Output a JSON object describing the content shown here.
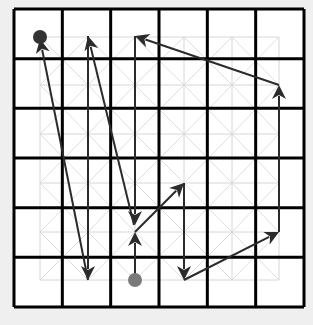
{
  "diagram": {
    "type": "grid-path",
    "grid": {
      "cols": 6,
      "rows": 6,
      "left": 14,
      "top": 9,
      "right": 304,
      "bottom": 307,
      "col_centers": [
        40,
        88,
        135,
        184,
        232,
        279
      ],
      "row_centers": [
        37,
        85,
        134,
        183,
        232,
        280
      ],
      "border_color": "#000000",
      "sub_grid_color": "#d6d6d6"
    },
    "markers": [
      {
        "name": "end-dot",
        "col": 0,
        "row": 0,
        "x": 40,
        "y": 37,
        "color": "#333333"
      },
      {
        "name": "start-dot",
        "col": 2,
        "row": 5,
        "x": 135,
        "y": 280,
        "color": "#7a7a7a"
      }
    ],
    "arrow_color": "#2b2b2b",
    "arrows": [
      {
        "from": [
          135,
          280
        ],
        "to": [
          135,
          232
        ]
      },
      {
        "from": [
          135,
          232
        ],
        "to": [
          184,
          183
        ]
      },
      {
        "from": [
          184,
          183
        ],
        "to": [
          184,
          280
        ]
      },
      {
        "from": [
          184,
          280
        ],
        "to": [
          279,
          232
        ]
      },
      {
        "from": [
          279,
          232
        ],
        "to": [
          279,
          85
        ]
      },
      {
        "from": [
          279,
          85
        ],
        "to": [
          135,
          36
        ]
      },
      {
        "from": [
          135,
          36
        ],
        "to": [
          135,
          225
        ]
      },
      {
        "from": [
          134,
          225
        ],
        "to": [
          88,
          36
        ]
      },
      {
        "from": [
          88,
          36
        ],
        "to": [
          88,
          280
        ]
      },
      {
        "from": [
          88,
          280
        ],
        "to": [
          40,
          39
        ]
      }
    ]
  }
}
